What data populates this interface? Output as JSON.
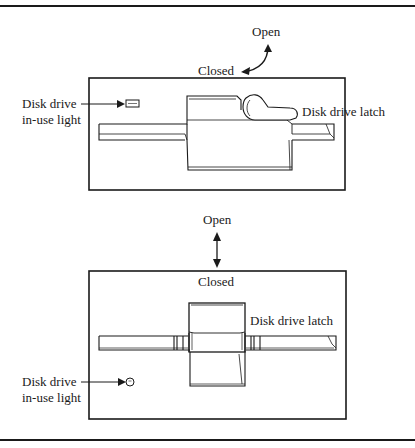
{
  "figure": {
    "top_diagram": {
      "direction_open_label": "Open",
      "direction_closed_label": "Closed",
      "light_label_line1": "Disk drive",
      "light_label_line2": "in-use light",
      "latch_label": "Disk drive latch",
      "light_shape": "rectangle",
      "arrow_type": "curved-double-arrow"
    },
    "bottom_diagram": {
      "direction_open_label": "Open",
      "direction_closed_label": "Closed",
      "light_label_line1": "Disk drive",
      "light_label_line2": "in-use light",
      "latch_label": "Disk drive latch",
      "light_shape": "circle",
      "arrow_type": "vertical-double-arrow"
    },
    "colors": {
      "ink": "#1a1a1a",
      "paper": "#ffffff"
    }
  }
}
